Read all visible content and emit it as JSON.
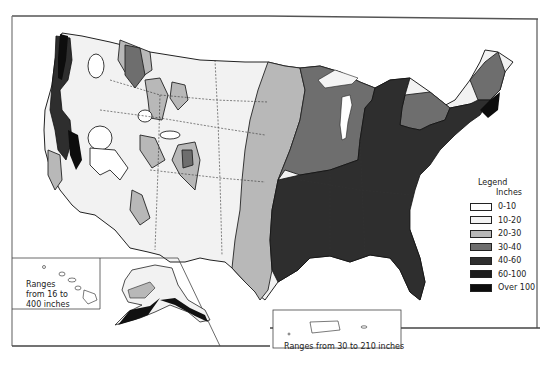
{
  "map": {
    "title": "Average annual precipitation, United States",
    "legend": {
      "title": "Legend",
      "unit": "Inches",
      "classes": [
        {
          "label": "0-10",
          "color": "#ffffff"
        },
        {
          "label": "10-20",
          "color": "#f3f3f3"
        },
        {
          "label": "20-30",
          "color": "#b8b8b8"
        },
        {
          "label": "30-40",
          "color": "#6e6e6e"
        },
        {
          "label": "40-60",
          "color": "#2e2e2e"
        },
        {
          "label": "60-100",
          "color": "#1c1c1c"
        },
        {
          "label": "Over 100",
          "color": "#0d0d0d"
        }
      ]
    },
    "insets": {
      "hawaii": {
        "line1": "Ranges",
        "line2": "from 16 to",
        "line3": "400 inches"
      },
      "puerto_rico": {
        "text": "Ranges from 30 to 210 inches"
      }
    }
  }
}
